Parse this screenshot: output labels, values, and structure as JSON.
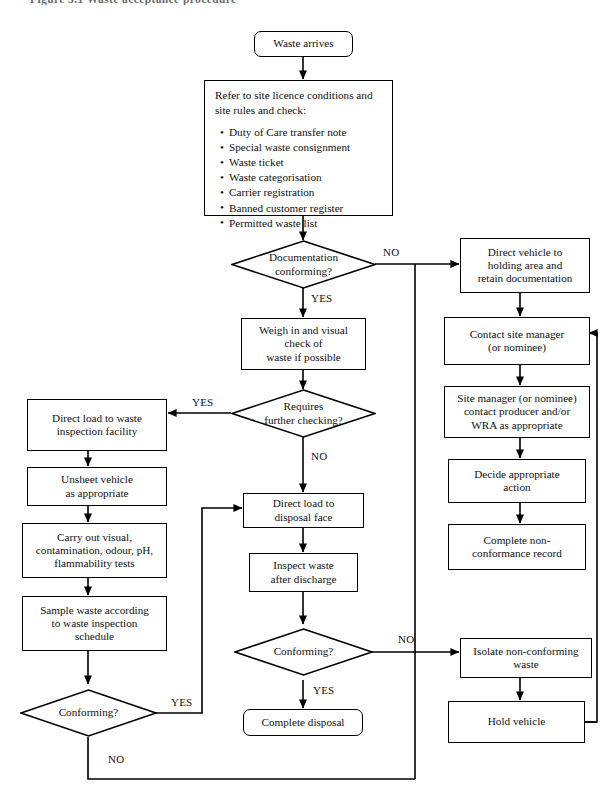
{
  "figure": {
    "caption": "Figure 3.1  Waste acceptance procedure"
  },
  "diagram": {
    "type": "flowchart",
    "nodes": [
      {
        "id": "waste-arrives",
        "shape": "terminal",
        "text": "Waste arrives"
      },
      {
        "id": "refer-site-licence",
        "shape": "process-list",
        "heading": "Refer to site licence conditions and\nsite rules and check:",
        "items": [
          "Duty of Care transfer note",
          "Special waste consignment",
          "Waste ticket",
          "Waste categorisation",
          "Carrier registration",
          "Banned customer register",
          "Permitted waste list"
        ]
      },
      {
        "id": "documentation-conforming",
        "shape": "decision",
        "text": "Documentation\nconforming?"
      },
      {
        "id": "weigh-in",
        "shape": "process",
        "text": "Weigh in and visual\ncheck of\nwaste if possible"
      },
      {
        "id": "requires-further-checking",
        "shape": "decision",
        "text": "Requires\nfurther checking?"
      },
      {
        "id": "direct-load-inspection",
        "shape": "process",
        "text": "Direct load to waste\ninspection facility"
      },
      {
        "id": "unsheet-vehicle",
        "shape": "process",
        "text": "Unsheet vehicle\nas appropriate"
      },
      {
        "id": "carry-out-tests",
        "shape": "process",
        "text": "Carry out visual,\ncontamination, odour, pH,\nflammability tests"
      },
      {
        "id": "sample-waste",
        "shape": "process",
        "text": "Sample waste according\nto waste inspection\nschedule"
      },
      {
        "id": "conforming-inspection",
        "shape": "decision",
        "text": "Conforming?"
      },
      {
        "id": "direct-load-disposal",
        "shape": "process",
        "text": "Direct load to\ndisposal face"
      },
      {
        "id": "inspect-waste",
        "shape": "process",
        "text": "Inspect waste\nafter discharge"
      },
      {
        "id": "conforming-discharge",
        "shape": "decision",
        "text": "Conforming?"
      },
      {
        "id": "complete-disposal",
        "shape": "terminal",
        "text": "Complete disposal"
      },
      {
        "id": "direct-vehicle-holding",
        "shape": "process",
        "text": "Direct vehicle to\nholding area and\nretain documentation"
      },
      {
        "id": "contact-site-manager",
        "shape": "process",
        "text": "Contact site manager\n(or nominee)"
      },
      {
        "id": "site-manager-contact-producer",
        "shape": "process",
        "text": "Site manager (or nominee)\ncontact producer and/or\nWRA as appropriate"
      },
      {
        "id": "decide-action",
        "shape": "process",
        "text": "Decide appropriate\naction"
      },
      {
        "id": "complete-non-conformance",
        "shape": "process",
        "text": "Complete non-\nconformance record"
      },
      {
        "id": "isolate-waste",
        "shape": "process",
        "text": "Isolate non-conforming\nwaste"
      },
      {
        "id": "hold-vehicle",
        "shape": "process",
        "text": "Hold vehicle"
      }
    ],
    "edge_labels": {
      "documentation_no": "NO",
      "documentation_yes": "YES",
      "further_checking_yes": "YES",
      "further_checking_no": "NO",
      "conforming_inspection_yes": "YES",
      "conforming_inspection_no": "NO",
      "conforming_discharge_no": "NO",
      "conforming_discharge_yes": "YES"
    },
    "edges": [
      {
        "from": "waste-arrives",
        "to": "refer-site-licence",
        "label": ""
      },
      {
        "from": "refer-site-licence",
        "to": "documentation-conforming",
        "label": ""
      },
      {
        "from": "documentation-conforming",
        "to": "direct-vehicle-holding",
        "label": "NO"
      },
      {
        "from": "documentation-conforming",
        "to": "weigh-in",
        "label": "YES"
      },
      {
        "from": "weigh-in",
        "to": "requires-further-checking",
        "label": ""
      },
      {
        "from": "requires-further-checking",
        "to": "direct-load-inspection",
        "label": "YES"
      },
      {
        "from": "requires-further-checking",
        "to": "direct-load-disposal",
        "label": "NO"
      },
      {
        "from": "direct-load-inspection",
        "to": "unsheet-vehicle",
        "label": ""
      },
      {
        "from": "unsheet-vehicle",
        "to": "carry-out-tests",
        "label": ""
      },
      {
        "from": "carry-out-tests",
        "to": "sample-waste",
        "label": ""
      },
      {
        "from": "sample-waste",
        "to": "conforming-inspection",
        "label": ""
      },
      {
        "from": "conforming-inspection",
        "to": "direct-load-disposal",
        "label": "YES"
      },
      {
        "from": "conforming-inspection",
        "to": "isolate-waste",
        "label": "NO"
      },
      {
        "from": "direct-load-disposal",
        "to": "inspect-waste",
        "label": ""
      },
      {
        "from": "inspect-waste",
        "to": "conforming-discharge",
        "label": ""
      },
      {
        "from": "conforming-discharge",
        "to": "complete-disposal",
        "label": "YES"
      },
      {
        "from": "conforming-discharge",
        "to": "isolate-waste",
        "label": "NO"
      },
      {
        "from": "direct-vehicle-holding",
        "to": "contact-site-manager",
        "label": ""
      },
      {
        "from": "contact-site-manager",
        "to": "site-manager-contact-producer",
        "label": ""
      },
      {
        "from": "site-manager-contact-producer",
        "to": "decide-action",
        "label": ""
      },
      {
        "from": "decide-action",
        "to": "complete-non-conformance",
        "label": ""
      },
      {
        "from": "isolate-waste",
        "to": "hold-vehicle",
        "label": ""
      },
      {
        "from": "hold-vehicle",
        "to": "contact-site-manager",
        "label": ""
      }
    ]
  },
  "colors": {
    "stroke": "#000000",
    "background": "#ffffff",
    "text": "#111111"
  }
}
